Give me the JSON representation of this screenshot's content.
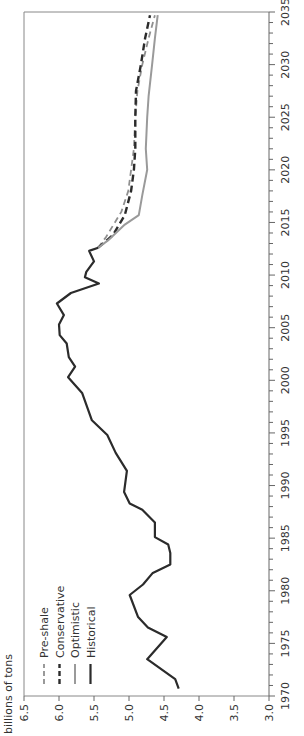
{
  "chart_data": {
    "type": "line",
    "title": "",
    "xlabel": "",
    "ylabel": "billions of tons",
    "orientation": "rotated -90 degrees (years run bottom-to-top along right edge)",
    "xlim": [
      1970,
      2035
    ],
    "ylim": [
      3.0,
      6.5
    ],
    "x_ticks": [
      1970,
      1975,
      1980,
      1985,
      1990,
      1995,
      2000,
      2005,
      2010,
      2015,
      2020,
      2025,
      2030,
      2035
    ],
    "y_ticks": [
      "3.0",
      "3.5",
      "4.0",
      "4.5",
      "5.0",
      "5.5",
      "6.0",
      "6.5"
    ],
    "grid": false,
    "legend_position": "upper-left (rotated)",
    "legend": [
      "Pre-shale",
      "Conservative",
      "Optimistic",
      "Historical"
    ],
    "series": [
      {
        "name": "Historical",
        "style": "solid",
        "color": "#2b2b2b",
        "width": 2.2,
        "points": [
          [
            1970.7,
            4.29
          ],
          [
            1971.6,
            4.34
          ],
          [
            1973.5,
            4.74
          ],
          [
            1975.6,
            4.46
          ],
          [
            1976.5,
            4.73
          ],
          [
            1977.5,
            4.87
          ],
          [
            1979.6,
            4.99
          ],
          [
            1980.6,
            4.8
          ],
          [
            1981.7,
            4.66
          ],
          [
            1982.5,
            4.41
          ],
          [
            1983.6,
            4.41
          ],
          [
            1984.4,
            4.44
          ],
          [
            1985.1,
            4.63
          ],
          [
            1986.5,
            4.63
          ],
          [
            1987.7,
            4.81
          ],
          [
            1988.3,
            4.99
          ],
          [
            1989.4,
            5.07
          ],
          [
            1991.4,
            5.03
          ],
          [
            1993.1,
            5.19
          ],
          [
            1994.8,
            5.31
          ],
          [
            1996.2,
            5.53
          ],
          [
            1998.8,
            5.67
          ],
          [
            2000.3,
            5.87
          ],
          [
            2001.3,
            5.77
          ],
          [
            2002.2,
            5.86
          ],
          [
            2003.5,
            5.89
          ],
          [
            2004.3,
            5.99
          ],
          [
            2005.3,
            6.0
          ],
          [
            2006.2,
            5.93
          ],
          [
            2007.3,
            6.03
          ],
          [
            2008.3,
            5.83
          ],
          [
            2009.2,
            5.43
          ],
          [
            2009.8,
            5.63
          ],
          [
            2010.3,
            5.61
          ],
          [
            2011.3,
            5.5
          ],
          [
            2012.3,
            5.57
          ],
          [
            2012.6,
            5.44
          ]
        ]
      },
      {
        "name": "Optimistic",
        "style": "solid",
        "color": "#9a9a9a",
        "width": 2,
        "points": [
          [
            2012.6,
            5.44
          ],
          [
            2013.3,
            5.3
          ],
          [
            2014.8,
            5.06
          ],
          [
            2015.7,
            4.86
          ],
          [
            2017.6,
            4.81
          ],
          [
            2020.0,
            4.74
          ],
          [
            2022.0,
            4.76
          ],
          [
            2025.0,
            4.74
          ],
          [
            2027.0,
            4.72
          ],
          [
            2030.0,
            4.67
          ],
          [
            2032.5,
            4.63
          ],
          [
            2034.7,
            4.59
          ]
        ]
      },
      {
        "name": "Conservative",
        "style": "dashed",
        "color": "#2b2b2b",
        "width": 2.4,
        "points": [
          [
            2012.6,
            5.44
          ],
          [
            2013.8,
            5.23
          ],
          [
            2015.7,
            5.06
          ],
          [
            2018.0,
            4.97
          ],
          [
            2020.0,
            4.93
          ],
          [
            2022.0,
            4.91
          ],
          [
            2025.0,
            4.91
          ],
          [
            2027.5,
            4.9
          ],
          [
            2030.0,
            4.83
          ],
          [
            2032.5,
            4.77
          ],
          [
            2034.7,
            4.7
          ]
        ]
      },
      {
        "name": "Pre-shale",
        "style": "dashed",
        "color": "#8f8f8f",
        "width": 1.8,
        "points": [
          [
            2012.6,
            5.44
          ],
          [
            2013.6,
            5.33
          ],
          [
            2016.0,
            5.11
          ],
          [
            2018.0,
            5.01
          ],
          [
            2020.0,
            4.97
          ],
          [
            2022.0,
            4.93
          ],
          [
            2025.0,
            4.91
          ],
          [
            2027.5,
            4.88
          ],
          [
            2030.0,
            4.81
          ],
          [
            2032.5,
            4.72
          ],
          [
            2034.7,
            4.63
          ]
        ]
      }
    ]
  },
  "colors": {
    "axis": "#666666",
    "frame": "#888888",
    "text": "#333333"
  }
}
